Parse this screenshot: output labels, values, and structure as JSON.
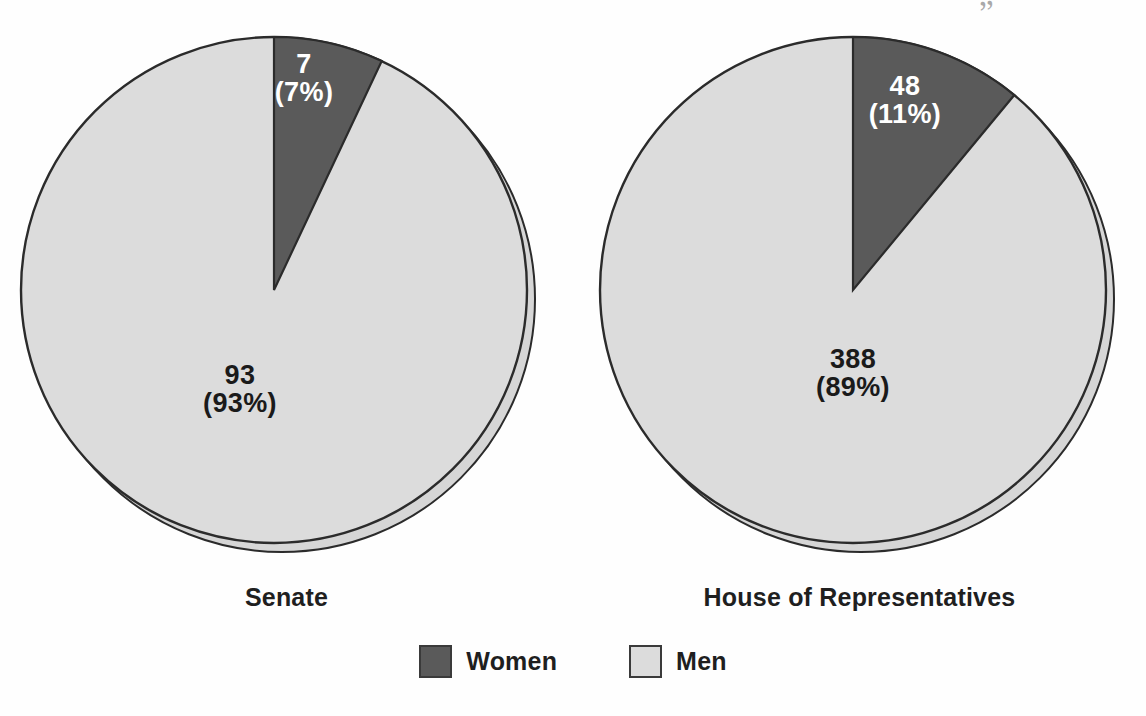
{
  "chart_data": {
    "type": "pie",
    "title": "",
    "legend_position": "bottom",
    "charts": [
      {
        "caption": "Senate",
        "categories": [
          "Women",
          "Men"
        ],
        "values": [
          7,
          93
        ],
        "percents": [
          7,
          93
        ],
        "labels": [
          "7\n(7%)",
          "93\n(93%)"
        ],
        "total": 100
      },
      {
        "caption": "House of Representatives",
        "categories": [
          "Women",
          "Men"
        ],
        "values": [
          48,
          388
        ],
        "percents": [
          11,
          89
        ],
        "labels": [
          "48\n(11%)",
          "388\n(89%)"
        ],
        "total": 436
      }
    ],
    "legend": [
      {
        "label": "Women",
        "color": "#5a5a5a"
      },
      {
        "label": "Men",
        "color": "#dcdcdc"
      }
    ]
  },
  "colors": {
    "women": "#5a5a5a",
    "men": "#dcdcdc",
    "shadow": "#d6d6d6",
    "outline": "#2b2b2b",
    "text": "#1f1f1f",
    "label_on_dark": "#ffffff"
  },
  "artifact": {
    "mark": "”"
  }
}
